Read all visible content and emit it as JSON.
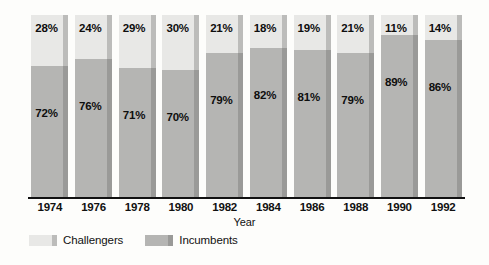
{
  "chart_data": {
    "type": "bar",
    "subtype": "stacked-100-percent",
    "title": "",
    "xlabel": "Year",
    "ylabel": "",
    "ylim": [
      0,
      100
    ],
    "grid": false,
    "legend_position": "bottom-left",
    "categories": [
      "1974",
      "1976",
      "1978",
      "1980",
      "1982",
      "1984",
      "1986",
      "1988",
      "1990",
      "1992"
    ],
    "series": [
      {
        "name": "Challengers",
        "color": "#e8e8e6",
        "values": [
          28,
          24,
          29,
          30,
          21,
          18,
          19,
          21,
          11,
          14
        ],
        "labels": [
          "28%",
          "24%",
          "29%",
          "30%",
          "21%",
          "18%",
          "19%",
          "21%",
          "11%",
          "14%"
        ]
      },
      {
        "name": "Incumbents",
        "color": "#b5b5b3",
        "values": [
          72,
          76,
          71,
          70,
          79,
          82,
          81,
          79,
          89,
          86
        ],
        "labels": [
          "72%",
          "76%",
          "71%",
          "70%",
          "79%",
          "82%",
          "81%",
          "79%",
          "89%",
          "86%"
        ]
      }
    ]
  },
  "axis": {
    "x_title": "Year",
    "tick_labels": [
      "1974",
      "1976",
      "1978",
      "1980",
      "1982",
      "1984",
      "1986",
      "1988",
      "1990",
      "1992"
    ]
  },
  "legend": {
    "items": [
      {
        "label": "Challengers",
        "color": "#e8e8e6",
        "edge_color": "#bcbcba"
      },
      {
        "label": "Incumbents",
        "color": "#b5b5b3",
        "edge_color": "#9a9a98"
      }
    ]
  },
  "colors": {
    "background": "#fdfdfb",
    "challengers": "#e8e8e6",
    "incumbents": "#b5b5b3",
    "shadow_top": "#bcbcba",
    "shadow_bottom": "#9a9a98",
    "axis": "#111111",
    "text": "#111111"
  }
}
